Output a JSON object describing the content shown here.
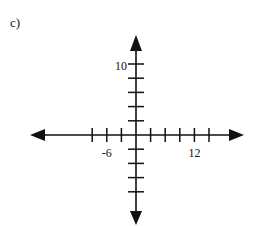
{
  "figure": {
    "label": "c)",
    "colors": {
      "axis": "#111111",
      "background": "#ffffff"
    }
  },
  "axes": {
    "x": {
      "tick_step": 3,
      "ticks_negative": 3,
      "ticks_positive": 5,
      "labels": [
        {
          "value": -6,
          "text": "-6"
        },
        {
          "value": 12,
          "text": "12"
        }
      ]
    },
    "y": {
      "tick_step": 2,
      "ticks_positive": 5,
      "ticks_negative": 4,
      "labels": [
        {
          "value": 10,
          "text": "10"
        }
      ]
    }
  }
}
